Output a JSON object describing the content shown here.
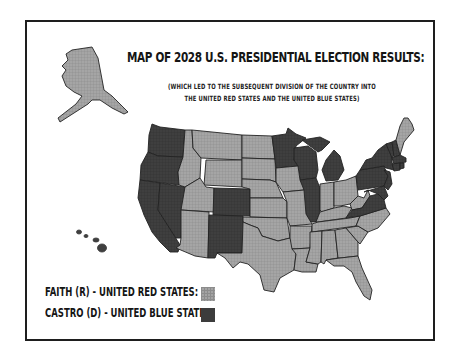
{
  "title": "MAP OF 2028 U.S. PRESIDENTIAL ELECTION RESULTS:",
  "subtitle": {
    "line1": "(WHICH LED TO THE SUBSEQUENT DIVISION OF THE COUNTRY INTO",
    "line2": "THE UNITED RED STATES AND THE UNITED BLUE STATES)"
  },
  "legend": [
    {
      "label": "FAITH (R) - UNITED RED STATES:",
      "color": "#a3a3a3",
      "party": "R"
    },
    {
      "label": "CASTRO (D) - UNITED BLUE STATES:",
      "color": "#3c3c3c",
      "party": "D"
    }
  ],
  "colors": {
    "red_fill": "#a3a3a3",
    "blue_fill": "#3c3c3c",
    "border": "#1e1e1e",
    "background": "#ffffff"
  },
  "states": {
    "blue": [
      "WA",
      "OR",
      "CA",
      "NV",
      "CO",
      "NM",
      "MN",
      "WI",
      "MI",
      "IL",
      "VA",
      "MD",
      "DE",
      "NJ",
      "PA",
      "NY",
      "CT",
      "RI",
      "MA",
      "VT",
      "NH",
      "HI"
    ],
    "red": [
      "AK",
      "ID",
      "MT",
      "WY",
      "UT",
      "AZ",
      "ND",
      "SD",
      "NE",
      "KS",
      "OK",
      "TX",
      "IA",
      "MO",
      "AR",
      "LA",
      "IN",
      "OH",
      "KY",
      "TN",
      "MS",
      "AL",
      "GA",
      "FL",
      "SC",
      "NC",
      "WV",
      "ME"
    ]
  }
}
